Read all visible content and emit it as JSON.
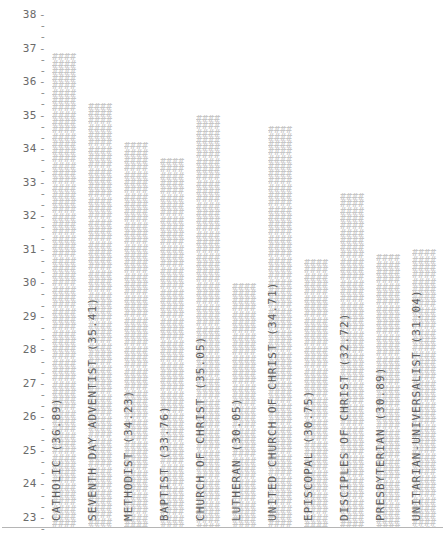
{
  "chart_data": {
    "type": "bar",
    "title": "",
    "xlabel": "",
    "ylabel": "",
    "ylim": [
      22.7,
      38.3
    ],
    "grid": false,
    "legend": "none",
    "orientation": "vertical",
    "bar_fill_glyph": "#",
    "categories": [
      "CATHOLIC",
      "SEVENTH DAY ADVENTIST",
      "METHODIST",
      "BAPTIST",
      "CHURCH OF CHRIST",
      "LUTHERAN",
      "UNITED CHURCH OF CHRIST",
      "EPISCOPAL",
      "DISCIPLES OF CHRIST",
      "PRESBYTERIAN",
      "UNITARIAN-UNIVERSALIST"
    ],
    "values": [
      36.89,
      35.41,
      34.23,
      33.76,
      35.05,
      30.05,
      34.71,
      30.75,
      32.72,
      30.89,
      31.04
    ],
    "bar_labels": [
      "CATHOLIC (36.89)",
      "SEVENTH DAY ADVENTIST (35.41)",
      "METHODIST (34.23)",
      "BAPTIST (33.76)",
      "CHURCH OF CHRIST (35.05)",
      "LUTHERAN (30.05)",
      "UNITED CHURCH OF CHRIST (34.71)",
      "EPISCOPAL (30.75)",
      "DISCIPLES OF CHRIST (32.72)",
      "PRESBYTERIAN (30.89)",
      "UNITARIAN-UNIVERSALIST (31.04)"
    ],
    "y_major_ticks": [
      38,
      37,
      36,
      35,
      34,
      33,
      32,
      31,
      30,
      29,
      28,
      27,
      26,
      25,
      24,
      23
    ],
    "y_minor_ticks_per_major": 2,
    "tick_glyph": "-",
    "colors": {
      "bar": "#c6c6c6",
      "text": "#5e5e5e",
      "tick": "#8a8a8a",
      "axis_line": "#b5b5b5",
      "background": "#ffffff"
    }
  }
}
